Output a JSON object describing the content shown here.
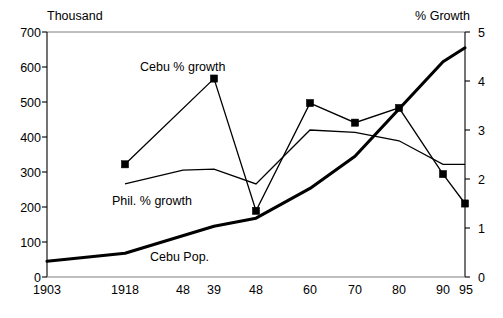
{
  "chart_data": {
    "type": "line",
    "title": "",
    "xlabel": "",
    "ylabel": "Thousand",
    "y2label": "% Growth",
    "grid": false,
    "legend_position": "inline-annotations",
    "categories": [
      "1903",
      "1918",
      "48",
      "39",
      "48",
      "60",
      "70",
      "80",
      "90",
      "95"
    ],
    "x_tick_labels": [
      "1903",
      "1918",
      "48",
      "39",
      "48",
      "60",
      "70",
      "80",
      "90",
      "95"
    ],
    "y_tick_labels": [
      "0",
      "100",
      "200",
      "300",
      "400",
      "500",
      "600",
      "700"
    ],
    "y2_tick_labels": [
      "0",
      "1",
      "2",
      "3",
      "4",
      "5"
    ],
    "ylim": [
      0,
      700
    ],
    "y2lim": [
      0,
      5
    ],
    "series": [
      {
        "name": "Cebu Pop.",
        "axis": "left",
        "style": "thick-line",
        "marker": "none",
        "x": [
          "1903",
          "1918",
          "39",
          "48",
          "60",
          "70",
          "80",
          "90",
          "95"
        ],
        "values": [
          45,
          68,
          145,
          168,
          253,
          345,
          480,
          615,
          655
        ]
      },
      {
        "name": "Cebu % growth",
        "axis": "right",
        "style": "thin-line",
        "marker": "square",
        "x": [
          "1918",
          "39",
          "48",
          "60",
          "70",
          "80",
          "90",
          "95"
        ],
        "values": [
          2.3,
          4.05,
          1.35,
          3.55,
          3.15,
          3.45,
          2.1,
          1.5
        ]
      },
      {
        "name": "Phil. % growth",
        "axis": "right",
        "style": "thin-line",
        "marker": "none",
        "x": [
          "1918",
          "48",
          "39",
          "48",
          "60",
          "70",
          "80",
          "90",
          "95"
        ],
        "values": [
          1.9,
          2.18,
          2.2,
          1.9,
          3.0,
          2.95,
          2.78,
          2.3,
          2.3
        ]
      }
    ],
    "annotations": [
      {
        "text": "Cebu % growth",
        "x": 140,
        "y": 60
      },
      {
        "text": "Phil. % growth",
        "x": 112,
        "y": 194
      },
      {
        "text": "Cebu Pop.",
        "x": 150,
        "y": 250
      }
    ]
  },
  "axes": {
    "left_title": "Thousand",
    "right_title": "% Growth"
  },
  "labels": {
    "cebu_growth": "Cebu % growth",
    "phil_growth": "Phil. % growth",
    "cebu_pop": "Cebu Pop."
  },
  "y_ticks": [
    {
      "label": "700",
      "top": 26
    },
    {
      "label": "600",
      "top": 61
    },
    {
      "label": "500",
      "top": 96
    },
    {
      "label": "400",
      "top": 131
    },
    {
      "label": "300",
      "top": 166
    },
    {
      "label": "200",
      "top": 201
    },
    {
      "label": "100",
      "top": 236
    },
    {
      "label": "0",
      "top": 271
    }
  ],
  "y2_ticks": [
    {
      "label": "5",
      "top": 26
    },
    {
      "label": "4",
      "top": 75
    },
    {
      "label": "3",
      "top": 124
    },
    {
      "label": "2",
      "top": 173
    },
    {
      "label": "1",
      "top": 222
    },
    {
      "label": "0",
      "top": 271
    }
  ],
  "x_ticks": [
    {
      "label": "1903",
      "left": 47
    },
    {
      "label": "1918",
      "left": 125
    },
    {
      "label": "48",
      "left": 183
    },
    {
      "label": "39",
      "left": 214
    },
    {
      "label": "48",
      "left": 256
    },
    {
      "label": "60",
      "left": 310
    },
    {
      "label": "70",
      "left": 355
    },
    {
      "label": "80",
      "left": 399
    },
    {
      "label": "90",
      "left": 443
    },
    {
      "label": "95",
      "left": 466
    }
  ]
}
